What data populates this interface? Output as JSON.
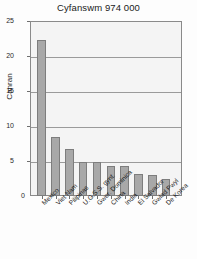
{
  "chart_data": {
    "type": "bar",
    "title": "Cyfanswm 974 000",
    "xlabel": "",
    "ylabel": "Canran",
    "ylim": [
      0,
      25
    ],
    "yticks": [
      0,
      5,
      10,
      15,
      20,
      25
    ],
    "grid": true,
    "legend": false,
    "categories": [
      "Mexico",
      "Viet Nam",
      "Pilipinas",
      "U.G.S.S. gynt.",
      "Gwer. Dominica",
      "China",
      "India",
      "El Salvador",
      "Gwlad Pwyl",
      "De Korea"
    ],
    "values": [
      22.3,
      8.5,
      6.7,
      4.9,
      4.8,
      4.3,
      4.3,
      3.2,
      3.0,
      2.4
    ],
    "bar_color": "#a8a8a8",
    "bar_edge_color": "#7d7d7d",
    "plot_background": "#f4f4f4",
    "axis_color": "#8a8a8a"
  },
  "axis": {
    "y_title": "Canran",
    "zero_label": "0"
  }
}
